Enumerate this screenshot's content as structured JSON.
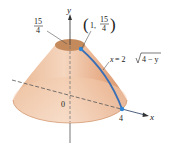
{
  "diagram": {
    "axes": {
      "x_label": "x",
      "y_label": "y",
      "origin_label": "0"
    },
    "annotations": {
      "top_height": {
        "numerator": "15",
        "denominator": "4"
      },
      "point": {
        "open": "(",
        "x": "1",
        "comma": ",",
        "numerator": "15",
        "denominator": "4",
        "close": ")"
      },
      "curve_equation": {
        "lhs": "x",
        "eq": " = 2",
        "radicand": "4 − y"
      },
      "x_intercept": "4"
    },
    "colors": {
      "surface_light": "#f6d9c2",
      "surface_mid": "#e7b08d",
      "surface_dark": "#d89a74",
      "top_cap": "#c48a5c",
      "curve": "#3a6fb5",
      "point": "#2f86d6",
      "axis": "#555555"
    }
  }
}
